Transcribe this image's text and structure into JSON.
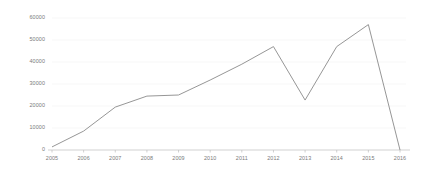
{
  "chart_data": {
    "type": "line",
    "title": "",
    "subtitle": "",
    "xlabel": "",
    "ylabel": "",
    "categories": [
      "2005",
      "2006",
      "2007",
      "2008",
      "2009",
      "2010",
      "2011",
      "2012",
      "2013",
      "2014",
      "2015",
      "2016"
    ],
    "x": [
      2005,
      2006,
      2007,
      2008,
      2009,
      2010,
      2011,
      2012,
      2013,
      2014,
      2015,
      2016
    ],
    "values": [
      1400,
      8600,
      19500,
      24500,
      25000,
      31800,
      39000,
      47000,
      22700,
      47000,
      57000,
      0
    ],
    "series": [
      {
        "name": "",
        "values": [
          1400,
          8600,
          19500,
          24500,
          25000,
          31800,
          39000,
          47000,
          22700,
          47000,
          57000,
          0
        ]
      }
    ],
    "xlim": [
      2005,
      2016
    ],
    "ylim": [
      0,
      60000
    ],
    "ytick_labels": [
      "0",
      "10000",
      "20000",
      "30000",
      "40000",
      "50000",
      "60000"
    ],
    "ytick_values": [
      0,
      10000,
      20000,
      30000,
      40000,
      50000,
      60000
    ],
    "xtick_labels": [
      "2005",
      "2006",
      "2007",
      "2008",
      "2009",
      "2010",
      "2011",
      "2012",
      "2013",
      "2014",
      "2015",
      "2016"
    ],
    "grid": "horizontal-faint",
    "legend": "none",
    "line_color": "#8a8a8a",
    "axis_color": "#bdbdbd",
    "grid_color": "#f2f2f2",
    "tick_label_color": "#7a7a7a",
    "background_color": "#ffffff"
  },
  "axes": {
    "y_ticks": [
      {
        "label": "60000",
        "value": 60000
      },
      {
        "label": "50000",
        "value": 50000
      },
      {
        "label": "40000",
        "value": 40000
      },
      {
        "label": "30000",
        "value": 30000
      },
      {
        "label": "20000",
        "value": 20000
      },
      {
        "label": "10000",
        "value": 10000
      },
      {
        "label": "0",
        "value": 0
      }
    ],
    "x_ticks": [
      {
        "label": "2005",
        "value": 2005
      },
      {
        "label": "2006",
        "value": 2006
      },
      {
        "label": "2007",
        "value": 2007
      },
      {
        "label": "2008",
        "value": 2008
      },
      {
        "label": "2009",
        "value": 2009
      },
      {
        "label": "2010",
        "value": 2010
      },
      {
        "label": "2011",
        "value": 2011
      },
      {
        "label": "2012",
        "value": 2012
      },
      {
        "label": "2013",
        "value": 2013
      },
      {
        "label": "2014",
        "value": 2014
      },
      {
        "label": "2015",
        "value": 2015
      },
      {
        "label": "2016",
        "value": 2016
      }
    ]
  }
}
